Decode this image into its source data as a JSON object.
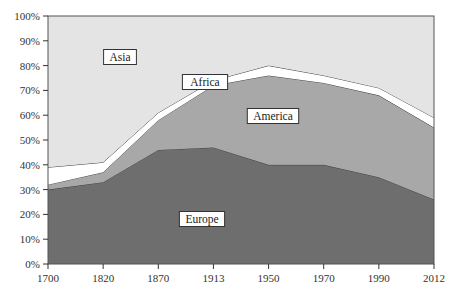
{
  "chart_data": {
    "type": "area",
    "stacked": true,
    "title": "",
    "xlabel": "",
    "ylabel": "",
    "categories": [
      "1700",
      "1820",
      "1870",
      "1913",
      "1950",
      "1970",
      "1990",
      "2012"
    ],
    "ylim": [
      0,
      100
    ],
    "yticks": [
      "0%",
      "10%",
      "20%",
      "30%",
      "40%",
      "50%",
      "60%",
      "70%",
      "80%",
      "90%",
      "100%"
    ],
    "grid": false,
    "legend": "inline labels",
    "series": [
      {
        "name": "Europe",
        "values": [
          30,
          33,
          46,
          47,
          40,
          40,
          35,
          26
        ],
        "color": "#6e6e6e"
      },
      {
        "name": "America",
        "values": [
          2,
          4,
          12,
          25,
          36,
          33,
          33,
          29
        ],
        "color": "#a8a8a8"
      },
      {
        "name": "Africa",
        "values": [
          7,
          4,
          3,
          2,
          4,
          3,
          3,
          4
        ],
        "color": "#ffffff"
      },
      {
        "name": "Asia",
        "values": [
          61,
          59,
          39,
          26,
          20,
          24,
          29,
          41
        ],
        "color": "#e4e4e4"
      }
    ],
    "cumulative_tops": {
      "Europe": [
        30,
        33,
        46,
        47,
        40,
        40,
        35,
        26
      ],
      "America": [
        32,
        37,
        58,
        72,
        76,
        73,
        68,
        55
      ],
      "Africa": [
        39,
        41,
        61,
        74,
        80,
        76,
        71,
        59
      ],
      "Asia": [
        100,
        100,
        100,
        100,
        100,
        100,
        100,
        100
      ]
    },
    "labels": {
      "Asia": "Asia",
      "Africa": "Africa",
      "America": "America",
      "Europe": "Europe"
    }
  }
}
